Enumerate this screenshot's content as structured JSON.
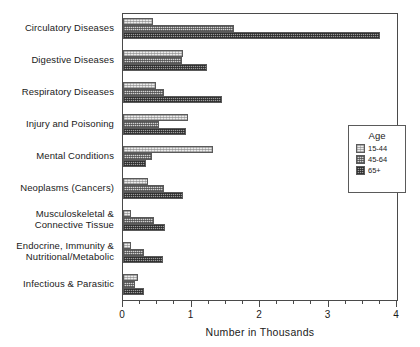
{
  "chart_data": {
    "type": "bar",
    "orientation": "horizontal",
    "title": "",
    "xlabel": "Number in Thousands",
    "ylabel": "",
    "xlim": [
      0,
      4
    ],
    "xticks": [
      0,
      1,
      2,
      3
    ],
    "xtick_labels": [
      "0",
      "1",
      "2",
      "3",
      "4"
    ],
    "minor_ticks_per_interval": 4,
    "grid": false,
    "legend": {
      "title": "Age",
      "position": "right",
      "entries": [
        "15-44",
        "45-64",
        "65+"
      ]
    },
    "categories": [
      "Circulatory Diseases",
      "Digestive Diseases",
      "Respiratory Diseases",
      "Injury and Poisoning",
      "Mental Conditions",
      "Neoplasms (Cancers)",
      "Musculoskeletal & Connective Tissue",
      "Endocrine, Immunity & Nutritional/Metabolic",
      "Infectious & Parasitic"
    ],
    "category_label_lines": [
      [
        "Circulatory Diseases"
      ],
      [
        "Digestive Diseases"
      ],
      [
        "Respiratory Diseases"
      ],
      [
        "Injury and Poisoning"
      ],
      [
        "Mental Conditions"
      ],
      [
        "Neoplasms (Cancers)"
      ],
      [
        "Musculoskeletal &",
        "Connective Tissue"
      ],
      [
        "Endocrine, Immunity &",
        "Nutritional/Metabolic"
      ],
      [
        "Infectious & Parasitic"
      ]
    ],
    "series": [
      {
        "name": "15-44",
        "swatch": "light-stipple",
        "color": "#ececec",
        "values": [
          0.44,
          0.88,
          0.48,
          0.95,
          1.32,
          0.36,
          0.11,
          0.12,
          0.22
        ]
      },
      {
        "name": "45-64",
        "swatch": "medium-stipple",
        "color": "#d2d2d2",
        "values": [
          1.62,
          0.86,
          0.6,
          0.53,
          0.43,
          0.6,
          0.45,
          0.31,
          0.18
        ]
      },
      {
        "name": "65+",
        "swatch": "dark-stipple",
        "color": "#9c9c9c",
        "values": [
          3.75,
          1.22,
          1.44,
          0.92,
          0.33,
          0.88,
          0.62,
          0.58,
          0.3
        ]
      }
    ]
  }
}
